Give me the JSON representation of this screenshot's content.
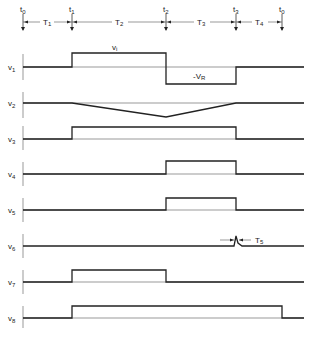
{
  "diagram": {
    "type": "timing-diagram",
    "time_markers": [
      {
        "label": "t",
        "sub": "0",
        "x": 23
      },
      {
        "label": "t",
        "sub": "1",
        "x": 72
      },
      {
        "label": "t",
        "sub": "2",
        "x": 166
      },
      {
        "label": "t",
        "sub": "3",
        "x": 236
      },
      {
        "label": "t",
        "sub": "0",
        "x": 282
      }
    ],
    "intervals": [
      {
        "label": "T",
        "sub": "1",
        "from": "t0",
        "to": "t1"
      },
      {
        "label": "T",
        "sub": "2",
        "from": "t1",
        "to": "t2"
      },
      {
        "label": "T",
        "sub": "3",
        "from": "t2",
        "to": "t3"
      },
      {
        "label": "T",
        "sub": "4",
        "from": "t3",
        "to": "t0"
      }
    ],
    "signals": [
      {
        "name": "v",
        "sub": "1",
        "description": "positive v_i from t1 to t2, negative -V_R from t2 to t3",
        "annotations": [
          "vi",
          "-VR"
        ]
      },
      {
        "name": "v",
        "sub": "2",
        "description": "linear ramp down from t1 to t2, ramp back up from t2 to t3"
      },
      {
        "name": "v",
        "sub": "3",
        "description": "high from t1 to t3"
      },
      {
        "name": "v",
        "sub": "4",
        "description": "high from t2 to t3"
      },
      {
        "name": "v",
        "sub": "5",
        "description": "high from t2 to t3"
      },
      {
        "name": "v",
        "sub": "6",
        "description": "narrow pulse of width T5 at t3",
        "annotations": [
          "T5"
        ]
      },
      {
        "name": "v",
        "sub": "7",
        "description": "high from t1 to t2"
      },
      {
        "name": "v",
        "sub": "8",
        "description": "high from t1 to end of T4"
      }
    ],
    "labels": {
      "vi": "v",
      "vi_sub": "i",
      "vr": "-V",
      "vr_sub": "R",
      "t5": "T",
      "t5_sub": "5"
    },
    "caption": ""
  }
}
